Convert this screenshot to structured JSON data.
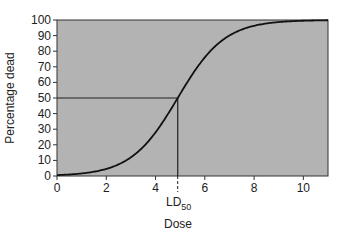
{
  "chart_data": {
    "type": "line",
    "title": "",
    "xlabel": "Dose",
    "ylabel": "Percentage dead",
    "xlim": [
      0,
      11
    ],
    "ylim": [
      0,
      100
    ],
    "x_ticks": [
      0,
      2,
      4,
      6,
      8,
      10
    ],
    "y_ticks": [
      0,
      10,
      20,
      30,
      40,
      50,
      60,
      70,
      80,
      90,
      100
    ],
    "grid": false,
    "legend": null,
    "background_color": "#b3b3b3",
    "line_color": "#111111",
    "series": [
      {
        "name": "Dose-response curve",
        "x": [
          0,
          1,
          2,
          3,
          4,
          4.9,
          6,
          7,
          8,
          9,
          10,
          11
        ],
        "y": [
          0.5,
          2,
          6,
          15,
          32,
          50,
          73,
          88,
          95,
          98,
          99.5,
          100
        ]
      }
    ],
    "annotations": [
      {
        "type": "hline",
        "y": 50,
        "x_from": 0,
        "x_to": 4.9
      },
      {
        "type": "vline",
        "x": 4.9,
        "y_from": 0,
        "y_to": 50,
        "extends_below_axis_dashed": true
      },
      {
        "type": "label",
        "text": "LD50",
        "main": "LD",
        "subscript": "50",
        "x": 4.9
      }
    ]
  }
}
